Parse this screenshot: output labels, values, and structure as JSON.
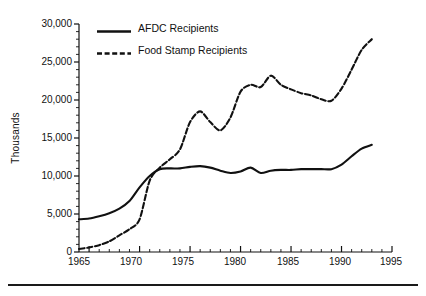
{
  "chart_data": {
    "type": "line",
    "title": "",
    "xlabel": "",
    "ylabel": "Thousands",
    "xlim": [
      1964,
      1995
    ],
    "ylim": [
      0,
      30000
    ],
    "grid": false,
    "legend_position": "top-left-inside",
    "xticks": [
      "1965",
      "1970",
      "1975",
      "1980",
      "1985",
      "1990",
      "1995"
    ],
    "xtick_values": [
      1965,
      1970,
      1975,
      1980,
      1985,
      1990,
      1995
    ],
    "yticks": [
      "0",
      "5,000",
      "10,000",
      "15,000",
      "20,000",
      "25,000",
      "30,000"
    ],
    "ytick_values": [
      0,
      5000,
      10000,
      15000,
      20000,
      25000,
      30000
    ],
    "minor_ticks": "yes",
    "series": [
      {
        "name": "AFDC Recipients",
        "style": "solid",
        "color": "#111111",
        "x": [
          1964,
          1965,
          1966,
          1967,
          1968,
          1969,
          1970,
          1971,
          1972,
          1973,
          1974,
          1975,
          1976,
          1977,
          1978,
          1979,
          1980,
          1981,
          1982,
          1983,
          1984,
          1985,
          1986,
          1987,
          1988,
          1989,
          1990,
          1991,
          1992,
          1993
        ],
        "values": [
          4300,
          4400,
          4700,
          5100,
          5700,
          6700,
          8500,
          10000,
          10900,
          11000,
          11000,
          11200,
          11300,
          11100,
          10700,
          10400,
          10600,
          11100,
          10400,
          10700,
          10800,
          10800,
          10900,
          10900,
          10900,
          10900,
          11500,
          12600,
          13600,
          14100
        ]
      },
      {
        "name": "Food Stamp Recipients",
        "style": "dashed",
        "color": "#111111",
        "x": [
          1964,
          1965,
          1966,
          1967,
          1968,
          1969,
          1970,
          1971,
          1972,
          1973,
          1974,
          1975,
          1976,
          1977,
          1978,
          1979,
          1980,
          1981,
          1982,
          1983,
          1984,
          1985,
          1986,
          1987,
          1988,
          1989,
          1990,
          1991,
          1992,
          1993
        ],
        "values": [
          400,
          600,
          900,
          1400,
          2200,
          3000,
          4300,
          9400,
          11100,
          12200,
          13500,
          17100,
          18500,
          17100,
          16000,
          17700,
          21100,
          22000,
          21700,
          23200,
          22000,
          21400,
          20900,
          20600,
          20100,
          19900,
          21500,
          24000,
          26600,
          28000
        ]
      }
    ]
  },
  "legend": {
    "items": [
      {
        "label": "AFDC Recipients",
        "style": "solid"
      },
      {
        "label": "Food Stamp Recipients",
        "style": "dashed"
      }
    ]
  }
}
